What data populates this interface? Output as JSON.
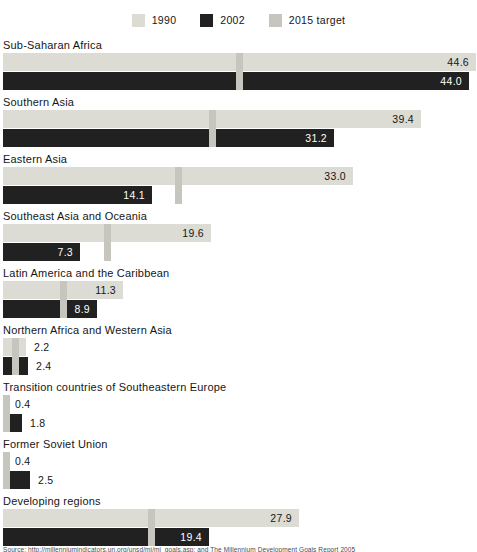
{
  "legend": {
    "items": [
      {
        "label": "1990",
        "color": "#dcdbd4"
      },
      {
        "label": "2002",
        "color": "#212121"
      },
      {
        "label": "2015 target",
        "color": "#c6c6bf"
      }
    ]
  },
  "colors": {
    "bar_1990": "#dcdbd4",
    "bar_2002": "#212121",
    "target_marker": "#c6c6bf",
    "value_on_light": "#161616",
    "value_on_dark": "#ffffff",
    "text": "#161616"
  },
  "chart_data": {
    "type": "bar",
    "orientation": "horizontal",
    "title": "",
    "xlabel": "",
    "ylabel": "",
    "xlim": [
      0,
      45
    ],
    "grid": false,
    "legend_position": "top-center",
    "categories": [
      "Sub-Saharan Africa",
      "Southern Asia",
      "Eastern Asia",
      "Southeast Asia and Oceania",
      "Latin America and the Caribbean",
      "Northern Africa and Western Asia",
      "Transition countries of Southeastern Europe",
      "Former Soviet Union",
      "Developing regions"
    ],
    "series": [
      {
        "name": "1990",
        "values": [
          44.6,
          39.4,
          33.0,
          19.6,
          11.3,
          2.2,
          0.4,
          0.4,
          27.9
        ]
      },
      {
        "name": "2002",
        "values": [
          44.0,
          31.2,
          14.1,
          7.3,
          8.9,
          2.4,
          1.8,
          2.5,
          19.4
        ]
      },
      {
        "name": "2015 target",
        "values": [
          22.3,
          19.7,
          16.5,
          9.8,
          5.7,
          1.1,
          0.2,
          0.2,
          14.0
        ],
        "rendered_as": "vertical tick marker spanning both bars"
      }
    ],
    "value_labels": "one decimal, inside bar end when bar is long, right of bar when short"
  },
  "source": {
    "text": "Source: http://millenniumindicators.un.org/unsd/mi/mi_goals.asp; and The Millennium Development Goals Report 2005"
  }
}
